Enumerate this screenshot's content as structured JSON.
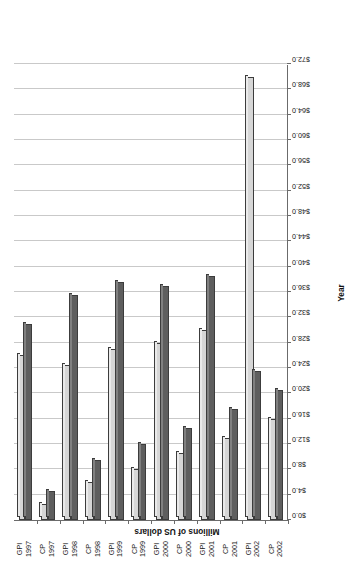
{
  "chart_data": {
    "type": "bar",
    "orientation": "vertical-rendered-rotated",
    "title": "",
    "xlabel": "Year",
    "ylabel": "Millions of US dollars",
    "ylim": [
      0.0,
      72.0
    ],
    "ytick_step": 4.0,
    "grid": true,
    "legend": null,
    "categories": [
      "GPI 1997",
      "CP 1997",
      "GPI 1998",
      "CP 1998",
      "GPI 1999",
      "CP 1999",
      "GPI 2000",
      "CP 2000",
      "GPI 2001",
      "CP 2001",
      "GPI 2002",
      "CP 2002"
    ],
    "category_lines": [
      [
        "GPI",
        "1997"
      ],
      [
        "CP",
        "1997"
      ],
      [
        "GPI",
        "1998"
      ],
      [
        "CP",
        "1998"
      ],
      [
        "GPI",
        "1999"
      ],
      [
        "CP",
        "1999"
      ],
      [
        "GPI",
        "2000"
      ],
      [
        "CP",
        "2000"
      ],
      [
        "GPI",
        "2001"
      ],
      [
        "CP",
        "2001"
      ],
      [
        "GPI",
        "2002"
      ],
      [
        "CP",
        "2002"
      ]
    ],
    "tick_labels": [
      "$0.0",
      "$4.0",
      "$8.0",
      "$12.0",
      "$16.0",
      "$20.0",
      "$24.0",
      "$28.0",
      "$32.0",
      "$36.0",
      "$40.0",
      "$44.0",
      "$48.0",
      "$52.0",
      "$56.0",
      "$60.0",
      "$64.0",
      "$68.0",
      "$72.0"
    ],
    "tick_values": [
      0,
      4,
      8,
      12,
      16,
      20,
      24,
      28,
      32,
      36,
      40,
      44,
      48,
      52,
      56,
      60,
      64,
      68,
      72
    ],
    "series": [
      {
        "name": "series-light",
        "color": "#d6d6d6",
        "values": [
          26.0,
          2.5,
          24.5,
          6.0,
          27.0,
          8.0,
          28.0,
          10.5,
          30.0,
          13.0,
          70.0,
          16.0
        ]
      },
      {
        "name": "series-dark",
        "color": "#5e5e5e",
        "values": [
          31.0,
          4.5,
          35.5,
          9.5,
          37.5,
          12.0,
          37.0,
          14.5,
          38.5,
          17.5,
          23.5,
          20.5
        ]
      }
    ]
  }
}
